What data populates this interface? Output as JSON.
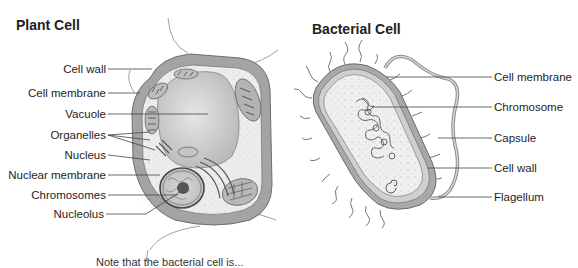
{
  "plant_cell": {
    "title": "Plant Cell",
    "labels": [
      {
        "text": "Cell wall",
        "y": 62
      },
      {
        "text": "Cell membrane",
        "y": 86
      },
      {
        "text": "Vacuole",
        "y": 107
      },
      {
        "text": "Organelles",
        "y": 128
      },
      {
        "text": "Nucleus",
        "y": 148
      },
      {
        "text": "Nuclear membrane",
        "y": 168
      },
      {
        "text": "Chromosomes",
        "y": 188
      },
      {
        "text": "Nucleolus",
        "y": 207
      }
    ]
  },
  "bacterial_cell": {
    "title": "Bacterial Cell",
    "labels": [
      {
        "text": "Cell membrane",
        "y": 70
      },
      {
        "text": "Chromosome",
        "y": 100
      },
      {
        "text": "Capsule",
        "y": 131
      },
      {
        "text": "Cell wall",
        "y": 161
      },
      {
        "text": "Flagellum",
        "y": 190
      }
    ]
  },
  "footnote": {
    "text": "Note that the bacterial cell is..."
  },
  "colors": {
    "cell_wall": "#9a9a9a",
    "cytoplasm": "#ededed",
    "vacuole": "#d0d0d0",
    "line": "#555555"
  }
}
